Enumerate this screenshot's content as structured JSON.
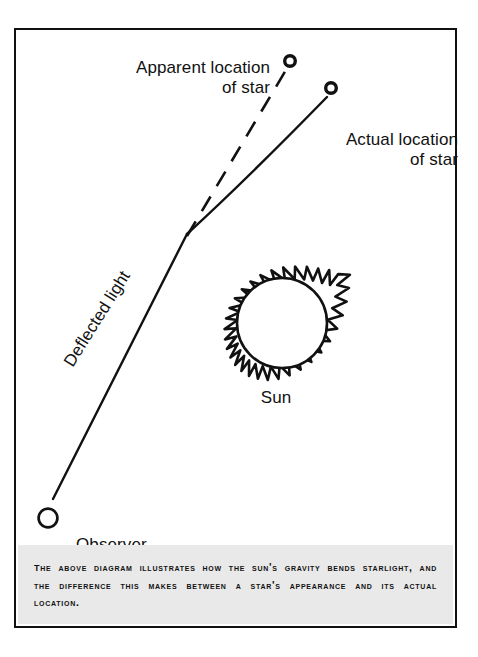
{
  "figure": {
    "background_color": "#ffffff",
    "frame_color": "#111111",
    "ink_color": "#111111",
    "caption_band_color": "#e9e9e9"
  },
  "labels": {
    "apparent_star": "Apparent location\nof star",
    "actual_star": "Actual location\nof star",
    "deflected_light": "Deflected light",
    "sun": "Sun",
    "observer": "Observer"
  },
  "caption": {
    "text": "The above diagram illustrates how the sun's gravity bends starlight, and the difference this makes between a star's appearance and its actual location."
  },
  "diagram_elements": {
    "apparent_star_marker": "open-circle",
    "actual_star_marker": "open-circle",
    "observer_marker": "open-circle",
    "apparent_ray_style": "dashed",
    "actual_ray_style": "solid",
    "sun_style": "circle-with-corona-spikes"
  }
}
